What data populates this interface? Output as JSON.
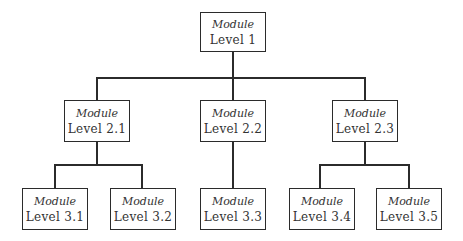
{
  "diagram": {
    "type": "hierarchy-tree",
    "nodes": {
      "n1": {
        "title": "Module",
        "label": "Level 1"
      },
      "n21": {
        "title": "Module",
        "label": "Level 2.1"
      },
      "n22": {
        "title": "Module",
        "label": "Level 2.2"
      },
      "n23": {
        "title": "Module",
        "label": "Level 2.3"
      },
      "n31": {
        "title": "Module",
        "label": "Level 3.1"
      },
      "n32": {
        "title": "Module",
        "label": "Level 3.2"
      },
      "n33": {
        "title": "Module",
        "label": "Level 3.3"
      },
      "n34": {
        "title": "Module",
        "label": "Level 3.4"
      },
      "n35": {
        "title": "Module",
        "label": "Level 3.5"
      }
    },
    "edges": [
      [
        "Level 1",
        "Level 2.1"
      ],
      [
        "Level 1",
        "Level 2.2"
      ],
      [
        "Level 1",
        "Level 2.3"
      ],
      [
        "Level 2.1",
        "Level 3.1"
      ],
      [
        "Level 2.1",
        "Level 3.2"
      ],
      [
        "Level 2.2",
        "Level 3.3"
      ],
      [
        "Level 2.3",
        "Level 3.4"
      ],
      [
        "Level 2.3",
        "Level 3.5"
      ]
    ],
    "colors": {
      "line": "#2b2b2b",
      "text": "#333333",
      "background": "#ffffff"
    }
  }
}
